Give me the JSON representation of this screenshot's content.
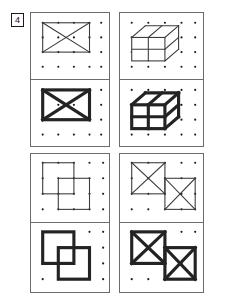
{
  "item": {
    "number": "4",
    "badge_name": "item-number-badge"
  },
  "grid": {
    "dot_columns": 5,
    "dot_rows": 4,
    "dot_color": "#1c1c1c",
    "panel_border_color": "#6b6b6b"
  },
  "strokes": {
    "thin_color": "#3a3a3a",
    "bold_color": "#232323",
    "thin_width": "1.1",
    "bold_width": "3.2"
  },
  "cells": [
    {
      "id": "cell-top-left",
      "position": "top-left",
      "figure": "rectangle-with-diagonals",
      "description": "Rectangle spanning 4 columns by 3 rows with both diagonals forming an X",
      "panels": [
        {
          "id": "panel-tl-thin",
          "weight": "thin",
          "label": "thin-outline-x-rectangle"
        },
        {
          "id": "panel-tl-bold",
          "weight": "bold",
          "label": "bold-outline-x-rectangle"
        }
      ]
    },
    {
      "id": "cell-top-right",
      "position": "top-right",
      "figure": "isometric-box-2x2",
      "description": "Three dimensional box with a two by two divided front face and depth extending up and to the right",
      "panels": [
        {
          "id": "panel-tr-thin",
          "weight": "thin",
          "label": "thin-outline-isometric-box"
        },
        {
          "id": "panel-tr-bold",
          "weight": "bold",
          "label": "bold-outline-isometric-box"
        }
      ]
    },
    {
      "id": "cell-bottom-left",
      "position": "bottom-left",
      "figure": "two-overlapping-squares",
      "description": "Two equal squares overlapping, the second offset one unit right and one unit down",
      "panels": [
        {
          "id": "panel-bl-thin",
          "weight": "thin",
          "label": "thin-outline-overlapping-squares"
        },
        {
          "id": "panel-bl-bold",
          "weight": "bold",
          "label": "bold-outline-overlapping-squares"
        }
      ]
    },
    {
      "id": "cell-bottom-right",
      "position": "bottom-right",
      "figure": "two-overlapping-x-squares",
      "description": "Two squares each containing both diagonals, overlapping with the second offset right and down",
      "panels": [
        {
          "id": "panel-br-thin",
          "weight": "thin",
          "label": "thin-outline-overlapping-x-squares"
        },
        {
          "id": "panel-br-bold",
          "weight": "bold",
          "label": "bold-outline-overlapping-x-squares"
        }
      ]
    }
  ]
}
